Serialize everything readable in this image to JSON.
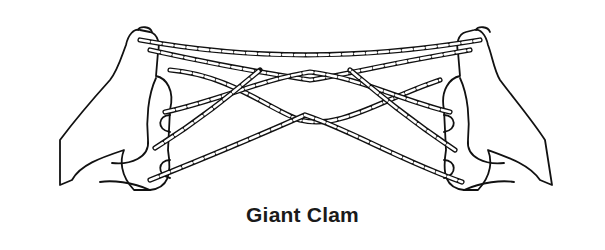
{
  "illustration": {
    "subject": "string figure held between two hands",
    "caption": "Giant Clam",
    "colors": {
      "ink": "#111111",
      "background": "#ffffff"
    }
  }
}
